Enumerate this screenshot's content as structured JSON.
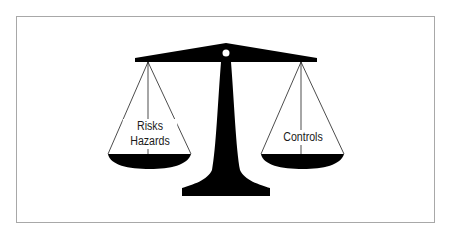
{
  "diagram": {
    "type": "balance-scale",
    "left_pan": {
      "lines": [
        "Risks",
        "Hazards"
      ]
    },
    "right_pan": {
      "lines": [
        "Controls"
      ]
    },
    "colors": {
      "ink": "#000000",
      "frame": "#a8a8a8",
      "background": "#ffffff"
    }
  }
}
